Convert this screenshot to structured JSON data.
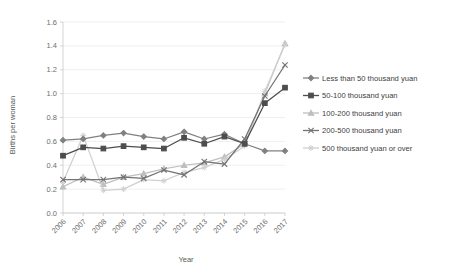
{
  "chart_data": {
    "type": "line",
    "title": "",
    "xlabel": "Year",
    "ylabel": "Births per woman",
    "categories": [
      "2006",
      "2007",
      "2008",
      "2009",
      "2010",
      "2011",
      "2012",
      "2013",
      "2014",
      "2015",
      "2016",
      "2017"
    ],
    "x": [
      2006,
      2007,
      2008,
      2009,
      2010,
      2011,
      2012,
      2013,
      2014,
      2015,
      2016,
      2017
    ],
    "ylim": [
      0.0,
      1.6
    ],
    "yticks": [
      "0.0",
      "0.2",
      "0.4",
      "0.6",
      "0.8",
      "1.0",
      "1.2",
      "1.4",
      "1.6"
    ],
    "ytick_values": [
      0.0,
      0.2,
      0.4,
      0.6,
      0.8,
      1.0,
      1.2,
      1.4,
      1.6
    ],
    "grid": true,
    "legend_position": "right",
    "series": [
      {
        "name": "Less than 50 thousand yuan",
        "color": "#808080",
        "marker": "diamond",
        "values": [
          0.61,
          0.62,
          0.65,
          0.67,
          0.64,
          0.62,
          0.68,
          0.62,
          0.66,
          0.58,
          0.52,
          0.52
        ]
      },
      {
        "name": "50-100 thousand yuan",
        "color": "#4d4d4d",
        "marker": "square",
        "values": [
          0.48,
          0.55,
          0.54,
          0.56,
          0.55,
          0.54,
          0.63,
          0.58,
          0.64,
          0.58,
          0.92,
          1.05
        ]
      },
      {
        "name": "100-200 thousand yuan",
        "color": "#bfbfbf",
        "marker": "triangle",
        "values": [
          0.22,
          0.3,
          0.24,
          0.3,
          0.33,
          0.37,
          0.4,
          0.42,
          0.47,
          0.58,
          1.0,
          1.42
        ]
      },
      {
        "name": "200-500 thousand yuan",
        "color": "#737373",
        "marker": "cross",
        "values": [
          0.28,
          0.28,
          0.28,
          0.3,
          0.29,
          0.36,
          0.32,
          0.43,
          0.41,
          0.62,
          0.98,
          1.24
        ]
      },
      {
        "name": "500 thousand yuan or over",
        "color": "#d0d0d0",
        "marker": "star",
        "values": [
          0.26,
          0.65,
          0.19,
          0.2,
          0.28,
          0.27,
          0.34,
          0.38,
          0.45,
          0.56,
          1.02,
          1.41
        ]
      }
    ]
  }
}
